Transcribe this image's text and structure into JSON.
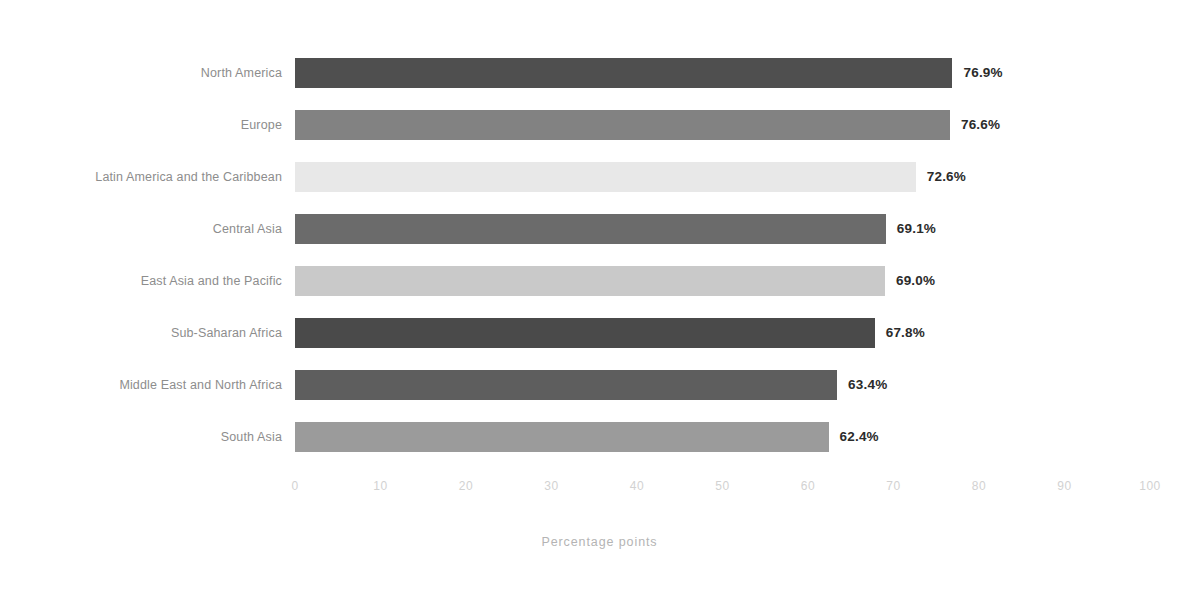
{
  "chart_data": {
    "type": "bar",
    "orientation": "horizontal",
    "title": "",
    "subtitle": "",
    "xlabel": "Percentage points",
    "ylabel": "",
    "xlim": [
      0,
      100
    ],
    "xticks": [
      0,
      10,
      20,
      30,
      40,
      50,
      60,
      70,
      80,
      90,
      100
    ],
    "xtick_labels": [
      "0",
      "10",
      "20",
      "30",
      "40",
      "50",
      "60",
      "70",
      "80",
      "90",
      "100"
    ],
    "grid": false,
    "legend": false,
    "categories": [
      "North America",
      "Europe",
      "Latin America and the Caribbean",
      "Central Asia",
      "East Asia and the Pacific",
      "Sub-Saharan Africa",
      "Middle East and North Africa",
      "South Asia"
    ],
    "values": [
      76.9,
      76.6,
      72.6,
      69.1,
      69.0,
      67.8,
      63.4,
      62.4
    ],
    "value_labels": [
      "76.9%",
      "76.6%",
      "72.6%",
      "69.1%",
      "69.0%",
      "67.8%",
      "63.4%",
      "62.4%"
    ],
    "bar_colors": [
      "#4f4f4f",
      "#828282",
      "#e8e8e8",
      "#6b6b6b",
      "#c9c9c9",
      "#4a4a4a",
      "#5e5e5e",
      "#9b9b9b"
    ]
  },
  "axis": {
    "title": "Percentage points"
  }
}
